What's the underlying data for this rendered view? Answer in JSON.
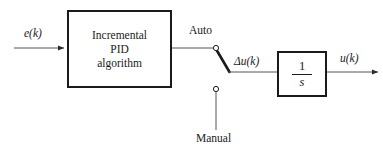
{
  "diagram": {
    "background_color": "#ffffff",
    "line_color": "#1a1a1a",
    "wire_color": "#555555",
    "blocks": [
      {
        "id": "pid",
        "lines": [
          "Incremental",
          "PID",
          "algorithm"
        ],
        "x": 67,
        "y": 10,
        "w": 105,
        "h": 78
      },
      {
        "id": "integrator",
        "numerator": "1",
        "denominator": "s",
        "x": 277,
        "y": 51,
        "w": 50,
        "h": 46
      }
    ],
    "labels": {
      "input": "e(k)",
      "auto": "Auto",
      "manual": "Manual",
      "delta_u": "Δu(k)",
      "output": "u(k)"
    },
    "switch": {
      "name": "auto-manual-switch",
      "position": "auto",
      "pivot": {
        "x": 216,
        "y": 48
      },
      "manual_terminal": {
        "x": 216,
        "y": 89
      },
      "blade_end": {
        "x": 229,
        "y": 72
      }
    }
  }
}
